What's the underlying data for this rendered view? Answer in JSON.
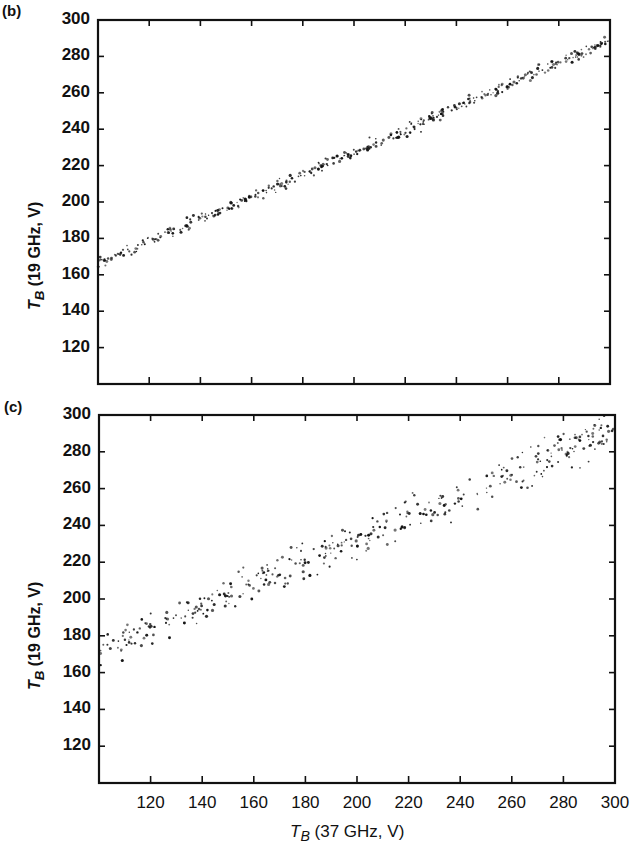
{
  "chart_data": [
    {
      "type": "scatter",
      "panel_label": "(b)",
      "title": "",
      "xlabel": "T_B (37 GHz, V)",
      "ylabel": "T_B (19 GHz, V)",
      "xlim": [
        100,
        300
      ],
      "ylim": [
        100,
        300
      ],
      "xticks": [
        120,
        140,
        160,
        180,
        200,
        220,
        240,
        260,
        280,
        300
      ],
      "yticks": [
        120,
        140,
        160,
        180,
        200,
        220,
        240,
        260,
        280,
        300
      ],
      "x_tick_labels_shown": false,
      "grid": false,
      "trend": {
        "x": [
          100,
          300
        ],
        "y": [
          166,
          289
        ]
      },
      "scatter_spread": 1.5,
      "n_points": 420,
      "sample_points": [
        [
          100,
          166
        ],
        [
          150,
          197
        ],
        [
          205,
          229
        ],
        [
          250,
          258
        ],
        [
          300,
          289
        ]
      ]
    },
    {
      "type": "scatter",
      "panel_label": "(c)",
      "title": "",
      "xlabel": "T_B (37 GHz, V)",
      "ylabel": "T_B (19 GHz, V)",
      "xlim": [
        100,
        300
      ],
      "ylim": [
        100,
        300
      ],
      "xticks": [
        120,
        140,
        160,
        180,
        200,
        220,
        240,
        260,
        280,
        300
      ],
      "yticks": [
        120,
        140,
        160,
        180,
        200,
        220,
        240,
        260,
        280,
        300
      ],
      "x_tick_labels_shown": true,
      "grid": false,
      "trend": {
        "x": [
          100,
          300
        ],
        "y": [
          172,
          292
        ]
      },
      "scatter_spread": 5,
      "n_points": 380,
      "sample_points": [
        [
          100,
          172
        ],
        [
          150,
          203
        ],
        [
          200,
          233
        ],
        [
          250,
          262
        ],
        [
          300,
          292
        ]
      ]
    }
  ],
  "panels": {
    "b": {
      "label": "(b)"
    },
    "c": {
      "label": "(c)"
    }
  },
  "axes": {
    "ylabel_prefix": "T",
    "ylabel_sub": "B",
    "ylabel_rest": " (19 GHz, V)",
    "xlabel_prefix": "T",
    "xlabel_sub": "B",
    "xlabel_rest": " (37 GHz, V)"
  },
  "colors": {
    "ink": "#111111",
    "background": "#ffffff"
  }
}
